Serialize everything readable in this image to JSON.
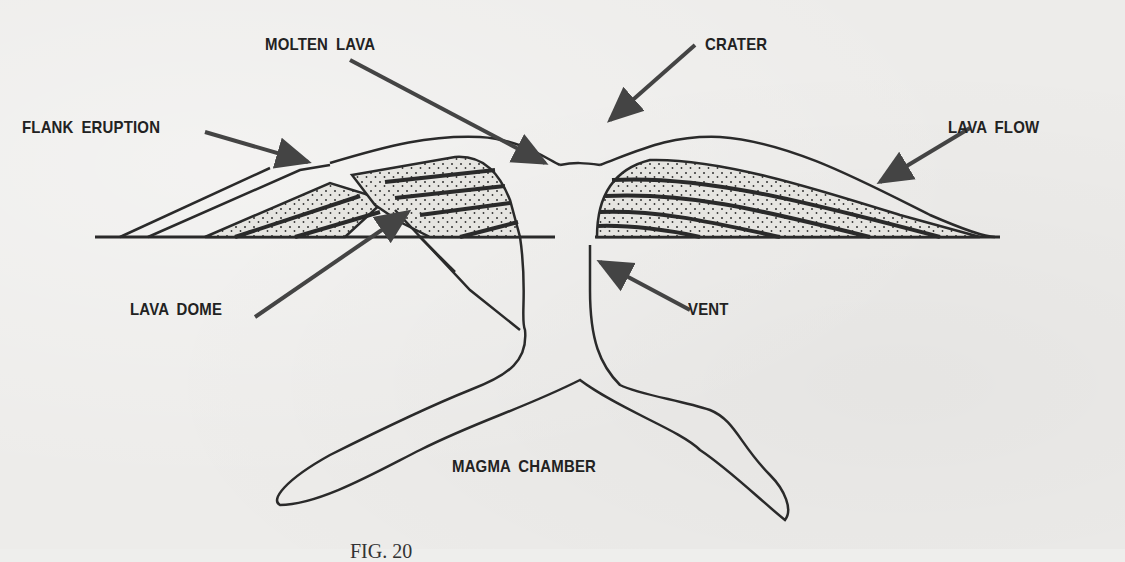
{
  "diagram": {
    "labels": {
      "molten_lava": "MOLTEN LAVA",
      "crater": "CRATER",
      "flank_eruption": "FLANK ERUPTION",
      "lava_flow": "LAVA FLOW",
      "lava_dome": "LAVA DOME",
      "vent": "VENT",
      "magma_chamber": "MAGMA CHAMBER"
    },
    "caption": "FIG. 20"
  },
  "colors": {
    "ink": "#2a2a2a",
    "paper": "#edecea",
    "stipple_fill": "#e4e3df"
  }
}
